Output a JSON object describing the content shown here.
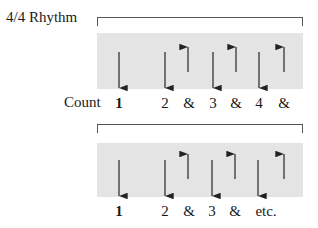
{
  "title": "4/4 Rhythm",
  "count_label": "Count",
  "colors": {
    "box": "#e4e4e4",
    "arrow": "#222222",
    "bracket": "#555555"
  },
  "diagram1": {
    "strokes": [
      {
        "dir": "down",
        "x": 119
      },
      {
        "dir": "down",
        "x": 165
      },
      {
        "dir": "up",
        "x": 188
      },
      {
        "dir": "down",
        "x": 213
      },
      {
        "dir": "up",
        "x": 236
      },
      {
        "dir": "down",
        "x": 259
      },
      {
        "dir": "up",
        "x": 284
      }
    ],
    "counts": [
      "1",
      "2",
      "&",
      "3",
      "&",
      "4",
      "&"
    ]
  },
  "diagram2": {
    "strokes": [
      {
        "dir": "down",
        "x": 119
      },
      {
        "dir": "down",
        "x": 165
      },
      {
        "dir": "up",
        "x": 188
      },
      {
        "dir": "down",
        "x": 212
      },
      {
        "dir": "up",
        "x": 235
      },
      {
        "dir": "down",
        "x": 258
      },
      {
        "dir": "up",
        "x": 284
      }
    ],
    "counts": [
      "1",
      "2",
      "&",
      "3",
      "&",
      "etc."
    ]
  }
}
